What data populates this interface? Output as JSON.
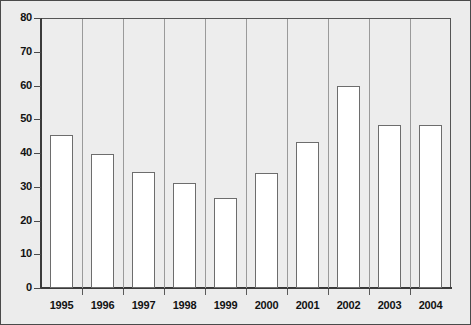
{
  "chart_data": {
    "type": "bar",
    "title": "",
    "xlabel": "",
    "ylabel": "",
    "categories": [
      "1995",
      "1996",
      "1997",
      "1998",
      "1999",
      "2000",
      "2001",
      "2002",
      "2003",
      "2004"
    ],
    "values": [
      45.3,
      39.6,
      34.3,
      31.2,
      26.6,
      34.0,
      43.4,
      59.9,
      48.4,
      48.2
    ],
    "ylim": [
      0,
      80
    ],
    "ytick_step": 10,
    "yticks": [
      "0",
      "10",
      "20",
      "30",
      "40",
      "50",
      "60",
      "70",
      "80"
    ],
    "grid": false,
    "legend": null,
    "bar_fill": "#ffffff",
    "bar_edge": "#6d6d6d",
    "plot_background": "#ededed",
    "frame_color": "#4a4a4a"
  }
}
